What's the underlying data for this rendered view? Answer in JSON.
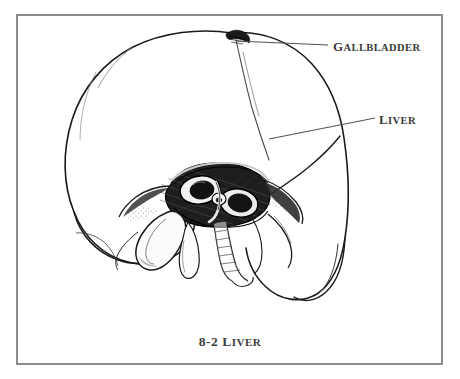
{
  "figure": {
    "domain_kind": "anatomical-line-drawing",
    "background_color": "#ffffff",
    "frame_color": "#8c8c8c",
    "ink_color": "#1a1a1a",
    "label_color": "#3a3a3a",
    "caption": {
      "lead": "8-2",
      "title_first_letter": "L",
      "title_rest": "IVER",
      "full_text": "8-2 LIVER"
    },
    "labels": [
      {
        "id": "gallbladder",
        "first_letter": "G",
        "rest": "ALLBLADDER",
        "full_text": "GALLBLADDER",
        "leader_from_x": 236,
        "leader_from_y": 41,
        "leader_to_x": 328,
        "leader_to_y": 44
      },
      {
        "id": "liver",
        "first_letter": "L",
        "rest": "IVER",
        "full_text": "LIVER",
        "leader_from_x": 269,
        "leader_from_y": 139,
        "leader_to_x": 375,
        "leader_to_y": 118
      }
    ],
    "structures": [
      "liver right lobe",
      "liver left lobe",
      "gallbladder",
      "porta hepatis",
      "portal vein",
      "hepatic artery",
      "common bile duct",
      "interlobar fissure"
    ]
  }
}
